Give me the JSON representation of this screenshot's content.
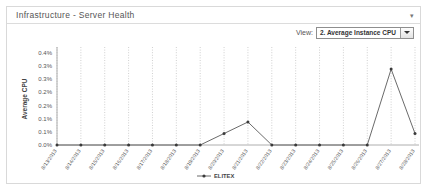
{
  "panel": {
    "title": "Infrastructure - Server Health",
    "menu_icon": "chevron-down-icon"
  },
  "view_selector": {
    "label": "View:",
    "selected": "2. Average Instance CPU",
    "arrow_icon": "chevron-down-icon"
  },
  "chart_data": {
    "type": "line",
    "title": "",
    "xlabel": "",
    "ylabel": "Average CPU",
    "ylim": [
      0,
      0.4
    ],
    "ytick_labels": [
      "0.4%",
      "0.3%",
      "0.3%",
      "0.2%",
      "0.2%",
      "0.1%",
      "0.1%",
      "0.0%"
    ],
    "ytick_values": [
      0.4,
      0.35,
      0.3,
      0.25,
      0.2,
      0.15,
      0.1,
      0.0
    ],
    "grid": true,
    "grid_orientation": "vertical",
    "legend": [
      "ELITEX"
    ],
    "legend_position": "bottom",
    "categories": [
      "8/13/2013",
      "8/14/2013",
      "8/15/2013",
      "8/16/2013",
      "8/17/2013",
      "8/18/2013",
      "8/19/2013",
      "8/20/2013",
      "8/21/2013",
      "8/22/2013",
      "8/23/2013",
      "8/24/2013",
      "8/25/2013",
      "8/26/2013",
      "8/27/2013",
      "8/28/2013"
    ],
    "series": [
      {
        "name": "ELITEX",
        "values": [
          0,
          0,
          0,
          0,
          0,
          0,
          0,
          0.05,
          0.1,
          0,
          0,
          0,
          0,
          0,
          0.33,
          0.05
        ]
      }
    ]
  }
}
